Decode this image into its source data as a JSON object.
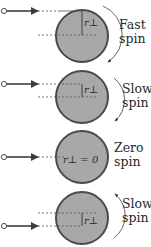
{
  "diagram": {
    "colors": {
      "disk_fill": "#a8a8a8",
      "disk_rim": "#4a4a4a",
      "arrow": "#3c3c3c",
      "dash": "#555555",
      "text": "#2a2a2a",
      "background": "#ffffff"
    },
    "panels": [
      {
        "id": "fast",
        "label_line1": "Fast",
        "label_line2": "spin",
        "r_label": "r⊥",
        "spin_direction": "clockwise"
      },
      {
        "id": "slow-cw",
        "label_line1": "Slow",
        "label_line2": "spin",
        "r_label": "r⊥",
        "spin_direction": "clockwise"
      },
      {
        "id": "zero",
        "label_line1": "Zero",
        "label_line2": "spin",
        "r_label": "r⊥ = 0",
        "spin_direction": "none"
      },
      {
        "id": "slow-ccw",
        "label_line1": "Slow",
        "label_line2": "spin",
        "r_label": "r⊥",
        "spin_direction": "counterclockwise"
      }
    ]
  }
}
